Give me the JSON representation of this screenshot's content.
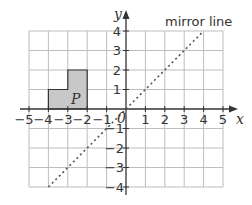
{
  "diagram": {
    "x_axis_label": "x",
    "y_axis_label": "y",
    "origin_label": "0",
    "x_ticks": [
      "−5",
      "−4",
      "−3",
      "−2",
      "−1",
      "1",
      "2",
      "3",
      "4",
      "5"
    ],
    "y_ticks": [
      "4",
      "3",
      "2",
      "1",
      "−1",
      "−2",
      "−3",
      "−4"
    ],
    "x_range": [
      -5,
      5
    ],
    "y_range": [
      -4,
      4
    ],
    "shape_label": "P",
    "shape_vertices": [
      [
        -4,
        0
      ],
      [
        -2,
        0
      ],
      [
        -2,
        2
      ],
      [
        -3,
        2
      ],
      [
        -3,
        1
      ],
      [
        -4,
        1
      ]
    ],
    "shape_fill": "#c8c8c8",
    "mirror_line_label": "mirror line",
    "mirror_line_equation": "y = x",
    "mirror_line_from": [
      -4,
      -4
    ],
    "mirror_line_to": [
      4,
      4
    ],
    "grid_color": "#bbbbbb",
    "axis_color": "#333333"
  }
}
